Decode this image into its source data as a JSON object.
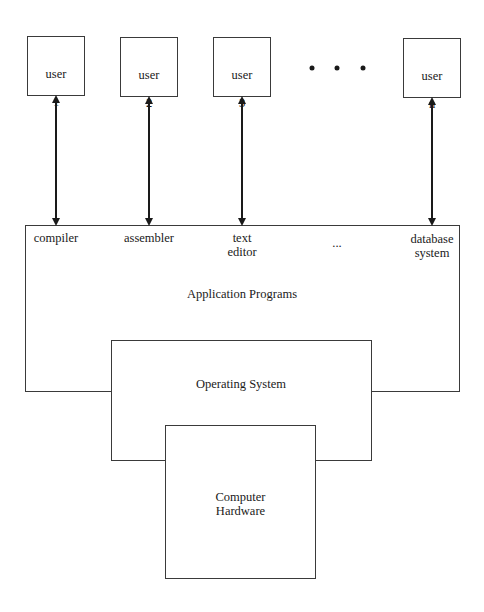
{
  "diagram": {
    "users": [
      {
        "line1": "user",
        "line2": "1"
      },
      {
        "line1": "user",
        "line2": "2"
      },
      {
        "line1": "user",
        "line2": "3"
      },
      {
        "line1": "user",
        "line2": "n"
      }
    ],
    "ellipsis_dots": "• • •",
    "applications": [
      {
        "label": "compiler"
      },
      {
        "label": "assembler"
      },
      {
        "label": "text\neditor"
      },
      {
        "label": "..."
      },
      {
        "label": "database\nsystem"
      }
    ],
    "layers": {
      "application_programs": "Application Programs",
      "operating_system": "Operating System",
      "computer_hardware": "Computer\nHardware"
    },
    "colors": {
      "line": "#1a1a1a",
      "box_border": "#3a3a3a",
      "background": "#ffffff"
    }
  }
}
